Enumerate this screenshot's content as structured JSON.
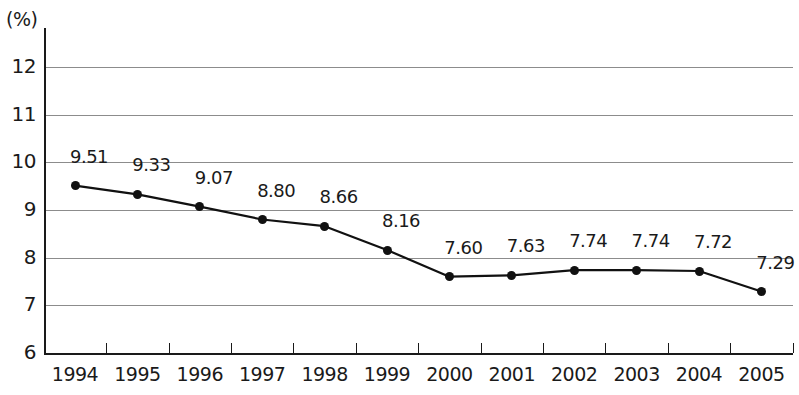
{
  "chart_data": {
    "type": "line",
    "title": "",
    "subtitle": "",
    "xlabel": "",
    "ylabel": "(%)",
    "unit_label": "(%)",
    "categories": [
      "1994",
      "1995",
      "1996",
      "1997",
      "1998",
      "1999",
      "2000",
      "2001",
      "2002",
      "2003",
      "2004",
      "2005"
    ],
    "values": [
      9.51,
      9.33,
      9.07,
      8.8,
      8.66,
      8.16,
      7.6,
      7.63,
      7.74,
      7.74,
      7.72,
      7.29
    ],
    "point_labels": [
      "9.51",
      "9.33",
      "9.07",
      "8.80",
      "8.66",
      "8.16",
      "7.60",
      "7.63",
      "7.74",
      "7.74",
      "7.72",
      "7.29"
    ],
    "ylim": [
      6,
      12
    ],
    "yticks": [
      6,
      7,
      8,
      9,
      10,
      11,
      12
    ],
    "ytick_labels": [
      "6",
      "7",
      "8",
      "9",
      "10",
      "11",
      "12"
    ],
    "grid": true,
    "legend": false,
    "series_color": "#111111",
    "grid_color": "#8c8c8c",
    "axis_color": "#1a1a1a",
    "background_color": "#ffffff"
  }
}
